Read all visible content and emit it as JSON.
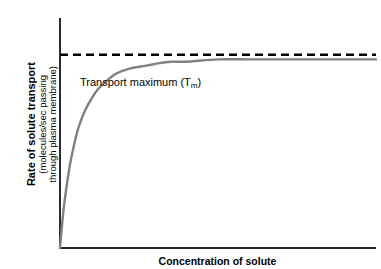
{
  "chart_data": {
    "type": "line",
    "title": "",
    "xlabel": "Concentration of solute",
    "ylabel_lines": [
      "Rate of solute transport",
      "(molecules/sec passing",
      "through plasma membrane)"
    ],
    "ylabel": "Rate of solute transport (molecules/sec passing through plasma membrane)",
    "grid": false,
    "legend": "none",
    "axis_ticks": {
      "x": [],
      "y": []
    },
    "xlim": [
      0,
      100
    ],
    "ylim": [
      0,
      100
    ],
    "annotations": [
      {
        "name": "transport-maximum",
        "text_prefix": "Transport maximum (T",
        "text_subscript": "m",
        "text_suffix": ")",
        "full_text": "Transport maximum (Tm)",
        "y_value": 84,
        "style": "dashed-horizontal-line"
      }
    ],
    "series": [
      {
        "name": "rate of solute transport",
        "color": "#808080",
        "style": "solid",
        "saturation_plateau": 82,
        "half_saturation_x": 11,
        "x": [
          0,
          1,
          2,
          3,
          4,
          5,
          6,
          8,
          10,
          12,
          15,
          18,
          22,
          26,
          30,
          35,
          40,
          50,
          60,
          70,
          80,
          90,
          100
        ],
        "y": [
          0,
          15,
          26,
          35,
          42,
          48,
          53,
          60,
          65,
          69,
          73,
          76,
          78,
          79,
          80,
          81,
          81,
          82,
          82,
          82,
          82,
          82,
          82
        ]
      }
    ],
    "asymptote_line": {
      "color": "#000000",
      "dash": "8,5",
      "y_value": 84
    }
  },
  "colors": {
    "curve": "#808080",
    "axis": "#2b2b2b",
    "dashed_line": "#000000",
    "background": "#ffffff",
    "text": "#000000"
  }
}
